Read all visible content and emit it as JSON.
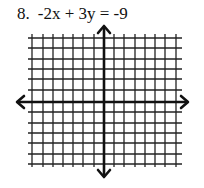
{
  "problem": {
    "number": "8.",
    "equation": "-2x + 3y = -9"
  },
  "graph": {
    "type": "coordinate-grid",
    "grid_columns": 14,
    "grid_rows": 12,
    "axes": "x and y with arrowheads on both ends",
    "line_color": "#111111",
    "background": "#ffffff"
  }
}
